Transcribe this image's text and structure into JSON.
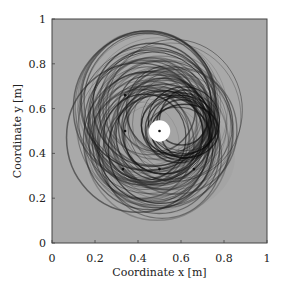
{
  "chart_data": {
    "type": "scatter",
    "title": "",
    "xlabel": "Coordinate x [m]",
    "ylabel": "Coordinate y [m]",
    "xlim": [
      0,
      1
    ],
    "ylim": [
      0,
      1
    ],
    "xticks": [
      "0",
      "0.2",
      "0.4",
      "0.6",
      "0.8",
      "1"
    ],
    "yticks": [
      "0",
      "0.2",
      "0.4",
      "0.6",
      "0.8",
      "1"
    ],
    "grid": false,
    "background_color": "#a9a9a9",
    "source_points": [
      {
        "x": 0.5,
        "y": 0.5,
        "role": "center (white disk)"
      },
      {
        "x": 0.34,
        "y": 0.66
      },
      {
        "x": 0.34,
        "y": 0.5
      },
      {
        "x": 0.33,
        "y": 0.33
      },
      {
        "x": 0.5,
        "y": 0.33
      },
      {
        "x": 0.66,
        "y": 0.33
      }
    ],
    "center_disk": {
      "x": 0.5,
      "y": 0.5,
      "radius": 0.05,
      "color": "#ffffff"
    },
    "wavefront_rings": {
      "description": "Overlapping concentric dark rings (wavefronts) centered around the source points, densest to the right of the center near x≈0.68",
      "radius_range": [
        0.18,
        0.34
      ]
    }
  }
}
